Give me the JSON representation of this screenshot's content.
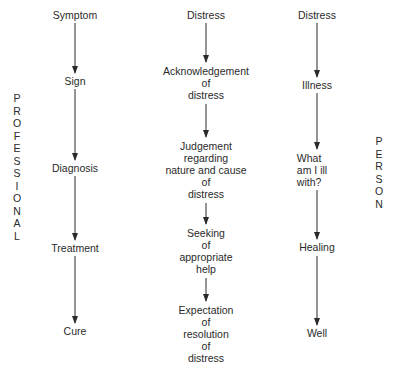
{
  "diagram": {
    "type": "flowchart",
    "side_labels": {
      "left": [
        "P",
        "R",
        "O",
        "F",
        "E",
        "S",
        "S",
        "I",
        "O",
        "N",
        "A",
        "L"
      ],
      "right": [
        "P",
        "E",
        "R",
        "S",
        "O",
        "N"
      ]
    },
    "columns": [
      {
        "id": "professional",
        "nodes": [
          {
            "lines": [
              "Symptom"
            ]
          },
          {
            "lines": [
              "Sign"
            ]
          },
          {
            "lines": [
              "Diagnosis"
            ]
          },
          {
            "lines": [
              "Treatment"
            ]
          },
          {
            "lines": [
              "Cure"
            ]
          }
        ]
      },
      {
        "id": "middle",
        "nodes": [
          {
            "lines": [
              "Distress"
            ]
          },
          {
            "lines": [
              "Acknowledgement",
              "of",
              "distress"
            ]
          },
          {
            "lines": [
              "Judgement",
              "regarding",
              "nature and cause",
              "of",
              "distress"
            ]
          },
          {
            "lines": [
              "Seeking",
              "of",
              "appropriate",
              "help"
            ]
          },
          {
            "lines": [
              "Expectation",
              "of",
              "resolution",
              "of",
              "distress"
            ]
          }
        ]
      },
      {
        "id": "person",
        "nodes": [
          {
            "lines": [
              "Distress"
            ]
          },
          {
            "lines": [
              "Illness"
            ]
          },
          {
            "lines": [
              "What",
              "am I ill",
              "with?"
            ]
          },
          {
            "lines": [
              "Healing"
            ]
          },
          {
            "lines": [
              "Well"
            ]
          }
        ]
      }
    ],
    "edges": [
      [
        "Symptom",
        "Sign"
      ],
      [
        "Sign",
        "Diagnosis"
      ],
      [
        "Diagnosis",
        "Treatment"
      ],
      [
        "Treatment",
        "Cure"
      ],
      [
        "Distress",
        "Acknowledgement of distress"
      ],
      [
        "Acknowledgement of distress",
        "Judgement regarding nature and cause of distress"
      ],
      [
        "Judgement regarding nature and cause of distress",
        "Seeking of appropriate help"
      ],
      [
        "Seeking of appropriate help",
        "Expectation of resolution of distress"
      ],
      [
        "Distress",
        "Illness"
      ],
      [
        "Illness",
        "What am I ill with?"
      ],
      [
        "What am I ill with?",
        "Healing"
      ],
      [
        "Healing",
        "Well"
      ]
    ]
  }
}
